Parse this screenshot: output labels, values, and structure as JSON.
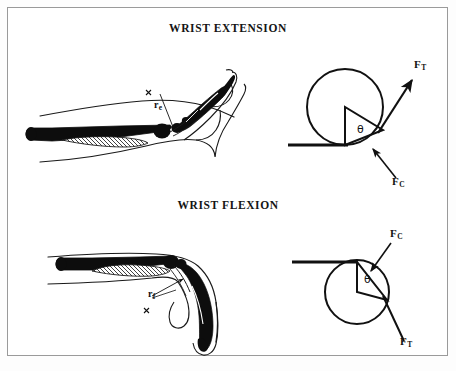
{
  "figure": {
    "background_color": "#ffffff",
    "border_color": "#9a9a9a",
    "ink_color": "#111111"
  },
  "panels": [
    {
      "id": "extension",
      "title": "WRIST EXTENSION",
      "anatomy_label": "r",
      "anatomy_subscript": "e",
      "force_tendon": "F",
      "force_tendon_sub": "T",
      "force_contact": "F",
      "force_contact_sub": "C",
      "angle_symbol": "θ"
    },
    {
      "id": "flexion",
      "title": "WRIST FLEXION",
      "anatomy_label": "r",
      "anatomy_subscript": "f",
      "force_tendon": "F",
      "force_tendon_sub": "T",
      "force_contact": "F",
      "force_contact_sub": "C",
      "angle_symbol": "θ"
    }
  ],
  "labels": {
    "title_extension": "WRIST EXTENSION",
    "title_flexion": "WRIST FLEXION",
    "r_e": "r",
    "r_e_sub": "e",
    "r_f": "r",
    "r_f_sub": "f",
    "ft_ext": "F",
    "ft_ext_sub": "T",
    "fc_ext": "F",
    "fc_ext_sub": "C",
    "fc_flex": "F",
    "fc_flex_sub": "C",
    "ft_flex": "F",
    "ft_flex_sub": "T",
    "theta_ext": "θ",
    "theta_flex": "θ"
  }
}
